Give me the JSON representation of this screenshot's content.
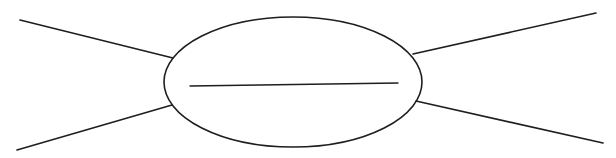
{
  "diagram": {
    "type": "spider-map",
    "stroke_color": "#1e1e1e",
    "background": "#ffffff",
    "center_ellipse": {
      "cx": 293,
      "cy": 82,
      "rx": 129,
      "ry": 65,
      "stroke_width": 1.6
    },
    "center_line": {
      "x1": 190,
      "y1": 86,
      "x2": 398,
      "y2": 83,
      "stroke_width": 1.3
    },
    "spokes": [
      {
        "id": "upper-left",
        "x1": 20,
        "y1": 20,
        "x2": 173,
        "y2": 58
      },
      {
        "id": "lower-left",
        "x1": 17,
        "y1": 150,
        "x2": 172,
        "y2": 105
      },
      {
        "id": "upper-right",
        "x1": 413,
        "y1": 54,
        "x2": 596,
        "y2": 13
      },
      {
        "id": "lower-right",
        "x1": 416,
        "y1": 101,
        "x2": 603,
        "y2": 143
      }
    ]
  }
}
